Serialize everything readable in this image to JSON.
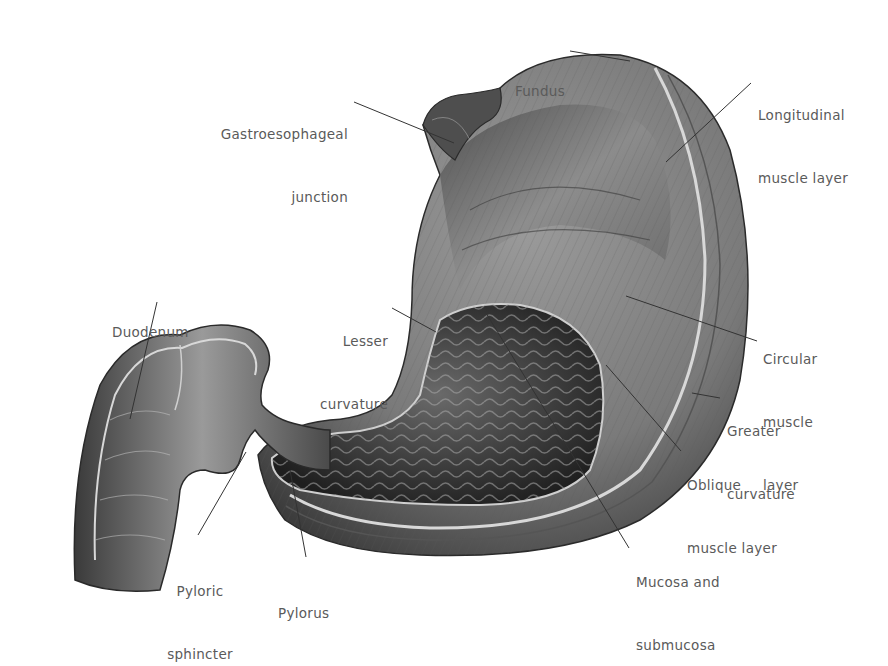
{
  "figure": {
    "labels": [
      {
        "id": "fundus",
        "lines": [
          "Fundus"
        ]
      },
      {
        "id": "gastroesophageal-junction",
        "lines": [
          "Gastroesophageal",
          "junction"
        ]
      },
      {
        "id": "longitudinal-muscle-layer",
        "lines": [
          "Longitudinal",
          "muscle layer"
        ]
      },
      {
        "id": "duodenum",
        "lines": [
          "Duodenum"
        ]
      },
      {
        "id": "lesser-curvature",
        "lines": [
          "Lesser",
          "curvature"
        ]
      },
      {
        "id": "circular-muscle-layer",
        "lines": [
          "Circular",
          "muscle",
          "layer"
        ]
      },
      {
        "id": "greater-curvature",
        "lines": [
          "Greater",
          "curvature"
        ]
      },
      {
        "id": "oblique-muscle-layer",
        "lines": [
          "Oblique",
          "muscle layer"
        ]
      },
      {
        "id": "mucosa-and-submucosa",
        "lines": [
          "Mucosa and",
          "submucosa"
        ]
      },
      {
        "id": "pyloric-sphincter",
        "lines": [
          "Pyloric",
          "sphincter"
        ]
      },
      {
        "id": "pylorus",
        "lines": [
          "Pylorus"
        ]
      }
    ]
  }
}
